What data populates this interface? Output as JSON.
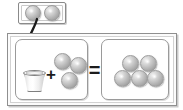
{
  "problem": {
    "type": "missing-addend-equation",
    "statement": "cup plus 3 balls equals 5 balls",
    "hidden_label": "",
    "plus_symbol": "+",
    "equals_symbol": "="
  },
  "hint_box": {
    "name": "hidden-quantity-box",
    "ball_count": 2,
    "balls": [
      "ball",
      "ball"
    ]
  },
  "left_panel": {
    "name": "addend-panel",
    "container": "cup",
    "visible_ball_count": 3,
    "balls": [
      "ball",
      "ball",
      "ball"
    ]
  },
  "right_panel": {
    "name": "sum-panel",
    "ball_count": 5,
    "balls": [
      "ball",
      "ball",
      "ball",
      "ball",
      "ball"
    ]
  },
  "arrow": {
    "name": "pour-into-cup-arrow",
    "direction": "down-into-cup"
  },
  "colors": {
    "frame_border": "#8f8f8f",
    "panel_border": "#9a9a9a",
    "ball_base": "#bcbcbc",
    "ball_highlight": "#f2f2f2",
    "operator": "#1c1c1c",
    "background": "#ffffff"
  }
}
